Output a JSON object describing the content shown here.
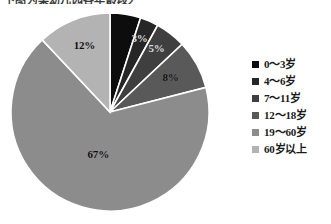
{
  "header": {
    "remnant_text": "下图为某幼儿园各年龄段人数比例："
  },
  "chart_data": {
    "type": "pie",
    "title": "",
    "categories": [
      "0～3岁",
      "4～6岁",
      "7～11岁",
      "12～18岁",
      "19～60岁",
      "60岁以上"
    ],
    "values": [
      5,
      3,
      5,
      8,
      67,
      12
    ],
    "value_labels": [
      "5%",
      "3%",
      "5%",
      "8%",
      "67%",
      "12%"
    ],
    "visible_labels": [
      "",
      "3%",
      "5%",
      "8%",
      "67%",
      "12%"
    ],
    "colors": [
      "#0d0d0d",
      "#262626",
      "#3f3f3f",
      "#595959",
      "#8c8c8c",
      "#b3b3b3"
    ],
    "slice_border_color": "#ffffff",
    "start_angle_deg": 0,
    "direction": "clockwise",
    "legend_position": "right",
    "grid": false,
    "center": {
      "x": 110,
      "y": 112
    },
    "radius": 99
  },
  "legend": {
    "items": [
      {
        "label": "0～3岁",
        "color": "#0d0d0d"
      },
      {
        "label": "4～6岁",
        "color": "#262626"
      },
      {
        "label": "7～11岁",
        "color": "#3f3f3f"
      },
      {
        "label": "12～18岁",
        "color": "#595959"
      },
      {
        "label": "19～60岁",
        "color": "#8c8c8c"
      },
      {
        "label": "60岁以上",
        "color": "#b3b3b3"
      }
    ]
  }
}
